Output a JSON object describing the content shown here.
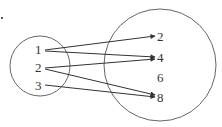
{
  "diagram": {
    "type": "mapping",
    "domain_set": {
      "elements": [
        "1",
        "2",
        "3"
      ]
    },
    "codomain_set": {
      "elements": [
        "2",
        "4",
        "6",
        "8"
      ]
    },
    "mappings": [
      {
        "from": "1",
        "to": "2"
      },
      {
        "from": "1",
        "to": "4"
      },
      {
        "from": "2",
        "to": "4"
      },
      {
        "from": "2",
        "to": "8"
      },
      {
        "from": "3",
        "to": "8"
      }
    ],
    "stroke_color": "#333333"
  }
}
